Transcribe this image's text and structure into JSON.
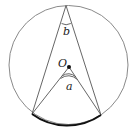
{
  "diagram": {
    "type": "circle-inscribed-central-angle",
    "circle": {
      "cx": 68.5,
      "cy": 65,
      "r": 59.5,
      "stroke": "#8a8a8a"
    },
    "center_point": {
      "label": "O",
      "x": 69,
      "y": 67
    },
    "top_vertex": {
      "x": 66,
      "y": 5
    },
    "arc_endpoints": [
      {
        "x": 32,
        "y": 114
      },
      {
        "x": 101,
        "y": 115
      }
    ],
    "angles": [
      {
        "label": "b",
        "at": "top_vertex",
        "kind": "inscribed"
      },
      {
        "label": "a",
        "at": "center_point",
        "kind": "central"
      }
    ],
    "highlighted_arc_color": "#111111",
    "line_color": "#555555"
  }
}
